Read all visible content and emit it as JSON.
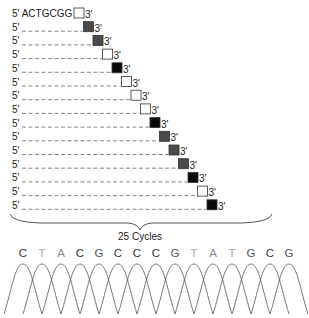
{
  "primer": {
    "five_prime": "5'",
    "sequence": "ACTGCGG",
    "three_prime": "3'",
    "marker": "white"
  },
  "rows": [
    {
      "five_prime": "5'",
      "three_prime": "3'",
      "marker": "gray"
    },
    {
      "five_prime": "5'",
      "three_prime": "3'",
      "marker": "gray"
    },
    {
      "five_prime": "5'",
      "three_prime": "3'",
      "marker": "white"
    },
    {
      "five_prime": "5'",
      "three_prime": "3'",
      "marker": "black"
    },
    {
      "five_prime": "5'",
      "three_prime": "3'",
      "marker": "white"
    },
    {
      "five_prime": "5'",
      "three_prime": "3'",
      "marker": "white"
    },
    {
      "five_prime": "5'",
      "three_prime": "3'",
      "marker": "white"
    },
    {
      "five_prime": "5'",
      "three_prime": "3'",
      "marker": "black"
    },
    {
      "five_prime": "5'",
      "three_prime": "3'",
      "marker": "gray"
    },
    {
      "five_prime": "5'",
      "three_prime": "3'",
      "marker": "gray"
    },
    {
      "five_prime": "5'",
      "three_prime": "3'",
      "marker": "gray"
    },
    {
      "five_prime": "5'",
      "three_prime": "3'",
      "marker": "black"
    },
    {
      "five_prime": "5'",
      "three_prime": "3'",
      "marker": "white"
    },
    {
      "five_prime": "5'",
      "three_prime": "3'",
      "marker": "black"
    }
  ],
  "brace_label": "25 Cycles",
  "chromatogram": {
    "bases": [
      "C",
      "T",
      "A",
      "C",
      "G",
      "C",
      "C",
      "C",
      "G",
      "T",
      "A",
      "T",
      "G",
      "C",
      "G"
    ]
  },
  "colors": {
    "marker_black": "#0a0a0a",
    "marker_gray": "#4a4a4a",
    "marker_white": "#ffffff",
    "base_C": "#333333",
    "base_G": "#555555",
    "base_A": "#888888",
    "base_T": "#aaaaaa",
    "line": "#555555"
  }
}
